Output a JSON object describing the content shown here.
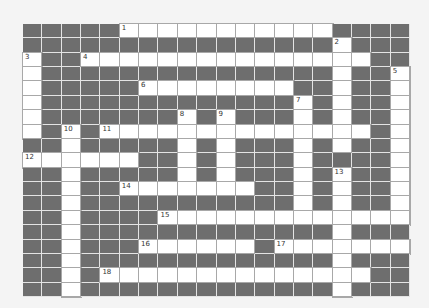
{
  "puzzle": {
    "cols": 20,
    "rows": 19,
    "colors": {
      "block": "#6e6e6e",
      "open": "#ffffff",
      "background": "#f4f4f4"
    },
    "grid": [
      ".....WWWWWWWWWWW....",
      "................W...",
      "W..WWWWWWWWWWWWWWW..",
      "W...............W..W",
      "W.....WWWWWWWW..W..W",
      "W.............W.W..W",
      "W.......W.W...W.W..W",
      "W.W.WWWWWWWWWWWWWW.W",
      "..W.....W.W...W.W..W",
      "WWWWWW..W.W...W....W",
      "..W.....W.W...W.W..W",
      "..W..WWWWWWW..W.W..W",
      "..W...........W.W..W",
      "..W....WWWWWWWWWWWWW",
      "..W.............W...",
      "..W...WWWWWW.WWWWWWW",
      "..W.............W...",
      "..W.WWWWWWWWWWWWWW..",
      "..W.............W..."
    ],
    "clue_numbers": [
      {
        "n": "1",
        "row": 0,
        "col": 5
      },
      {
        "n": "2",
        "row": 1,
        "col": 16
      },
      {
        "n": "3",
        "row": 2,
        "col": 0
      },
      {
        "n": "4",
        "row": 2,
        "col": 3
      },
      {
        "n": "5",
        "row": 3,
        "col": 19
      },
      {
        "n": "6",
        "row": 4,
        "col": 6
      },
      {
        "n": "7",
        "row": 5,
        "col": 14
      },
      {
        "n": "8",
        "row": 6,
        "col": 8
      },
      {
        "n": "9",
        "row": 6,
        "col": 10
      },
      {
        "n": "10",
        "row": 7,
        "col": 2
      },
      {
        "n": "11",
        "row": 7,
        "col": 4
      },
      {
        "n": "12",
        "row": 9,
        "col": 0
      },
      {
        "n": "13",
        "row": 10,
        "col": 16
      },
      {
        "n": "14",
        "row": 11,
        "col": 5
      },
      {
        "n": "15",
        "row": 13,
        "col": 7
      },
      {
        "n": "16",
        "row": 15,
        "col": 6
      },
      {
        "n": "17",
        "row": 15,
        "col": 13
      },
      {
        "n": "18",
        "row": 17,
        "col": 4
      }
    ]
  }
}
